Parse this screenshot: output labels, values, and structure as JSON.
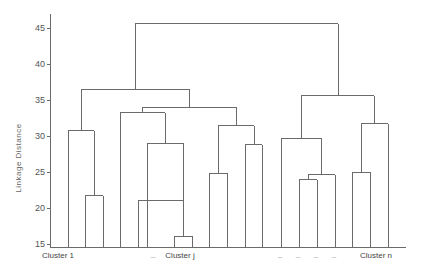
{
  "chart_data": {
    "type": "dendrogram",
    "title": "",
    "xlabel": "",
    "ylabel": "Linkage Distance",
    "ylim": [
      15,
      47
    ],
    "yticks": [
      15,
      20,
      25,
      30,
      35,
      40,
      45
    ],
    "leaf_labels": [
      {
        "text": "Cluster 1",
        "x": 58
      },
      {
        "text": "...",
        "x": 153
      },
      {
        "text": "Cluster j",
        "x": 180
      },
      {
        "text": "...",
        "x": 280
      },
      {
        "text": "...",
        "x": 298
      },
      {
        "text": "...",
        "x": 316
      },
      {
        "text": "...",
        "x": 334
      },
      {
        "text": "Cluster n",
        "x": 376
      }
    ],
    "leaves_x": [
      68,
      85,
      103,
      120,
      138,
      156,
      174,
      192,
      209,
      227,
      245,
      262,
      281,
      299,
      317,
      335,
      352,
      370,
      388
    ],
    "merges": [
      {
        "left_x": 85,
        "right_x": 103,
        "height": 21.7
      },
      {
        "left_x": 68,
        "right_x": 94,
        "height": 30.7
      },
      {
        "left_x": 174,
        "right_x": 192,
        "height": 16.1
      },
      {
        "left_x": 138,
        "right_x": 183,
        "height": 21.1,
        "note": "left child leaf at 138 height 21.1"
      },
      {
        "left_x": 147,
        "right_x": 183,
        "height": 29.0
      },
      {
        "left_x": 120,
        "right_x": 165,
        "height": 33.2
      },
      {
        "left_x": 209,
        "right_x": 227,
        "height": 24.8
      },
      {
        "left_x": 245,
        "right_x": 262,
        "height": 28.8
      },
      {
        "left_x": 218,
        "right_x": 254,
        "height": 31.4
      },
      {
        "left_x": 142,
        "right_x": 236,
        "height": 34.0
      },
      {
        "left_x": 81,
        "right_x": 189,
        "height": 36.5
      },
      {
        "left_x": 299,
        "right_x": 317,
        "height": 23.9
      },
      {
        "left_x": 308,
        "right_x": 335,
        "height": 24.6
      },
      {
        "left_x": 281,
        "right_x": 321,
        "height": 29.7
      },
      {
        "left_x": 352,
        "right_x": 370,
        "height": 25.0
      },
      {
        "left_x": 361,
        "right_x": 388,
        "height": 31.7
      },
      {
        "left_x": 301,
        "right_x": 374,
        "height": 35.6
      },
      {
        "left_x": 135,
        "right_x": 338,
        "height": 45.6
      }
    ]
  }
}
